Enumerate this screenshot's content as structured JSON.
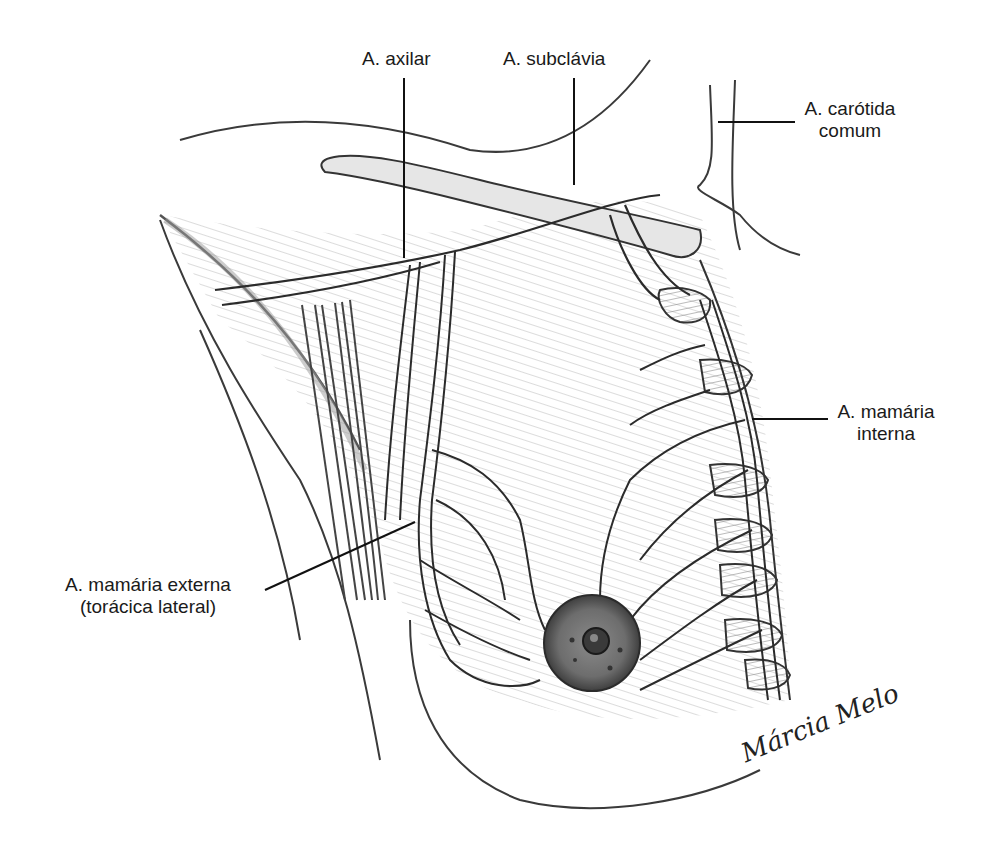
{
  "figure": {
    "type": "anatomical-illustration",
    "style": "pencil drawing",
    "background": "#ffffff",
    "stroke_color": "#2b2b2b",
    "shade_color": "#9a9a9a"
  },
  "labels": {
    "axilar": "A. axilar",
    "subclavia": "A. subclávia",
    "carotida_line1": "A. carótida",
    "carotida_line2": "comum",
    "mamaria_interna_line1": "A. mamária",
    "mamaria_interna_line2": "interna",
    "mamaria_externa_line1": "A. mamária externa",
    "mamaria_externa_line2": "(torácica lateral)"
  },
  "signature": "Márcia Melo"
}
